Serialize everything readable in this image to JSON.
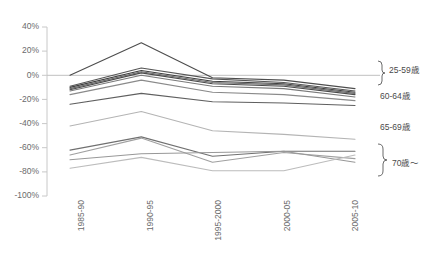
{
  "chart_data": {
    "type": "line",
    "title": "",
    "subtitle": "",
    "xlabel": "",
    "ylabel": "",
    "grid": false,
    "legend_position": "right",
    "ylim": [
      -100,
      40
    ],
    "ytick_labels": [
      "40%",
      "20%",
      "0%",
      "-20%",
      "-40%",
      "-60%",
      "-80%",
      "-100%"
    ],
    "ytick_values": [
      40,
      20,
      0,
      -20,
      -40,
      -60,
      -80,
      -100
    ],
    "categories": [
      "1985-90",
      "1990-95",
      "1995-2000",
      "2000-05",
      "2005-10"
    ],
    "series": [
      {
        "name": "s1",
        "group": "25-59歳",
        "color": "#4d4d4d",
        "values": [
          0,
          27,
          -2,
          -4,
          -11
        ]
      },
      {
        "name": "s2",
        "group": "25-59歳",
        "color": "#555555",
        "values": [
          -9,
          6,
          -3,
          -6,
          -13
        ]
      },
      {
        "name": "s3",
        "group": "25-59歳",
        "color": "#3f3f3f",
        "values": [
          -10,
          4,
          -5,
          -7,
          -14
        ]
      },
      {
        "name": "s4",
        "group": "25-59歳",
        "color": "#6a6a6a",
        "values": [
          -11,
          3,
          -6,
          -8,
          -15
        ]
      },
      {
        "name": "s5",
        "group": "25-59歳",
        "color": "#4a4a4a",
        "values": [
          -12,
          2,
          -7,
          -9,
          -16
        ]
      },
      {
        "name": "s6",
        "group": "25-59歳",
        "color": "#7a7a7a",
        "values": [
          -13,
          0,
          -9,
          -11,
          -18
        ]
      },
      {
        "name": "s7",
        "group": "60-64歳",
        "color": "#8a8a8a",
        "values": [
          -16,
          -4,
          -14,
          -16,
          -21
        ]
      },
      {
        "name": "s8",
        "group": "60-64歳",
        "color": "#5f5f5f",
        "values": [
          -24,
          -15,
          -22,
          -23,
          -25
        ]
      },
      {
        "name": "s9",
        "group": "65-69歳",
        "color": "#b4b4b4",
        "values": [
          -42,
          -30,
          -46,
          -49,
          -53
        ]
      },
      {
        "name": "s10",
        "group": "70歳～",
        "color": "#707070",
        "values": [
          -62,
          -51,
          -67,
          -63,
          -63
        ]
      },
      {
        "name": "s11",
        "group": "70歳～",
        "color": "#a0a0a0",
        "values": [
          -66,
          -52,
          -72,
          -64,
          -69
        ]
      },
      {
        "name": "s12",
        "group": "70歳～",
        "color": "#989898",
        "values": [
          -70,
          -65,
          -64,
          -63,
          -72
        ]
      },
      {
        "name": "s13",
        "group": "70歳～",
        "color": "#bcbcbc",
        "values": [
          -77,
          -68,
          -79,
          -79,
          -66
        ]
      }
    ],
    "annotations": [
      {
        "label": "25-59歳",
        "type": "brace-group"
      },
      {
        "label": "60-64歳",
        "type": "plain-label"
      },
      {
        "label": "65-69歳",
        "type": "plain-label"
      },
      {
        "label": "70歳～",
        "type": "brace-group"
      }
    ]
  }
}
